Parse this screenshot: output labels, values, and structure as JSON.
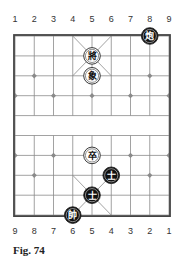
{
  "board": {
    "origin_x": 15,
    "origin_y": 36,
    "col_spacing": 19.25,
    "row_spacing": 19.9,
    "columns": 9,
    "rows": 10,
    "line_color": "#8a8a8a",
    "border_color": "#444444"
  },
  "top_labels": [
    "1",
    "2",
    "3",
    "4",
    "5",
    "6",
    "7",
    "8",
    "9"
  ],
  "bottom_labels": [
    "9",
    "8",
    "7",
    "6",
    "5",
    "4",
    "3",
    "2",
    "1"
  ],
  "star_points": [
    {
      "col": 2,
      "row": 3
    },
    {
      "col": 8,
      "row": 3
    },
    {
      "col": 1,
      "row": 4
    },
    {
      "col": 3,
      "row": 4
    },
    {
      "col": 5,
      "row": 4
    },
    {
      "col": 7,
      "row": 4
    },
    {
      "col": 9,
      "row": 4
    },
    {
      "col": 1,
      "row": 7
    },
    {
      "col": 3,
      "row": 7
    },
    {
      "col": 7,
      "row": 7
    },
    {
      "col": 9,
      "row": 7
    },
    {
      "col": 2,
      "row": 8
    },
    {
      "col": 8,
      "row": 8
    }
  ],
  "pieces": [
    {
      "name": "black-cannon",
      "char": "炮",
      "side": "black",
      "col": 8,
      "row": 1
    },
    {
      "name": "white-general",
      "char": "將",
      "side": "white",
      "col": 5,
      "row": 2
    },
    {
      "name": "white-elephant",
      "char": "象",
      "side": "white",
      "col": 5,
      "row": 3
    },
    {
      "name": "white-soldier",
      "char": "卒",
      "side": "white",
      "col": 5,
      "row": 7
    },
    {
      "name": "black-advisor",
      "char": "士",
      "side": "black",
      "col": 6,
      "row": 8
    },
    {
      "name": "black-advisor",
      "char": "士",
      "side": "black",
      "col": 5,
      "row": 9
    },
    {
      "name": "black-general",
      "char": "帥",
      "side": "black",
      "col": 4,
      "row": 10
    }
  ],
  "caption": "Fig. 74"
}
